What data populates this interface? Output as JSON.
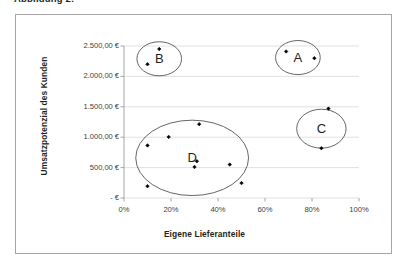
{
  "caption": {
    "text": "Abbildung 2:"
  },
  "chart_data": {
    "type": "scatter",
    "title": "",
    "xlabel": "Eigene Lieferanteile",
    "ylabel": "Umsatzpotenzial des Kunden",
    "xlim": [
      0,
      100
    ],
    "ylim": [
      0,
      2500
    ],
    "grid": true,
    "grid_axis": "y",
    "legend": "none",
    "x_tick_labels": [
      "0%",
      "20%",
      "40%",
      "60%",
      "80%",
      "100%"
    ],
    "x_tick_values": [
      0,
      20,
      40,
      60,
      80,
      100
    ],
    "y_tick_labels": [
      "-   €",
      "500,00 €",
      "1.000,00 €",
      "1.500,00 €",
      "2.000,00 €",
      "2.500,00 €"
    ],
    "y_tick_values": [
      0,
      500,
      1000,
      1500,
      2000,
      2500
    ],
    "marker_color": "#000000",
    "marker_shape": "diamond",
    "points": [
      {
        "x": 15,
        "y": 2450,
        "cluster": "B"
      },
      {
        "x": 10,
        "y": 2200,
        "cluster": "B"
      },
      {
        "x": 69,
        "y": 2410,
        "cluster": "A"
      },
      {
        "x": 81,
        "y": 2300,
        "cluster": "A"
      },
      {
        "x": 87,
        "y": 1470,
        "cluster": "C"
      },
      {
        "x": 84,
        "y": 820,
        "cluster": "C"
      },
      {
        "x": 32,
        "y": 1215,
        "cluster": "D"
      },
      {
        "x": 19,
        "y": 1005,
        "cluster": "D"
      },
      {
        "x": 10,
        "y": 865,
        "cluster": "D"
      },
      {
        "x": 31,
        "y": 605,
        "cluster": "D"
      },
      {
        "x": 30,
        "y": 510,
        "cluster": "D"
      },
      {
        "x": 45,
        "y": 550,
        "cluster": "D"
      },
      {
        "x": 10,
        "y": 195,
        "cluster": "D"
      },
      {
        "x": 50,
        "y": 245,
        "cluster": "D"
      }
    ],
    "annotations": [
      {
        "label": "A",
        "shape": "circle",
        "cx": 74,
        "cy": 2310,
        "rx": 9.5,
        "ry": 280
      },
      {
        "label": "B",
        "shape": "circle",
        "cx": 15,
        "cy": 2290,
        "rx": 9.5,
        "ry": 280
      },
      {
        "label": "C",
        "shape": "circle",
        "cx": 84,
        "cy": 1140,
        "rx": 10.5,
        "ry": 320
      },
      {
        "label": "D",
        "shape": "ellipse",
        "cx": 29,
        "cy": 660,
        "rx": 24,
        "ry": 620
      }
    ]
  }
}
